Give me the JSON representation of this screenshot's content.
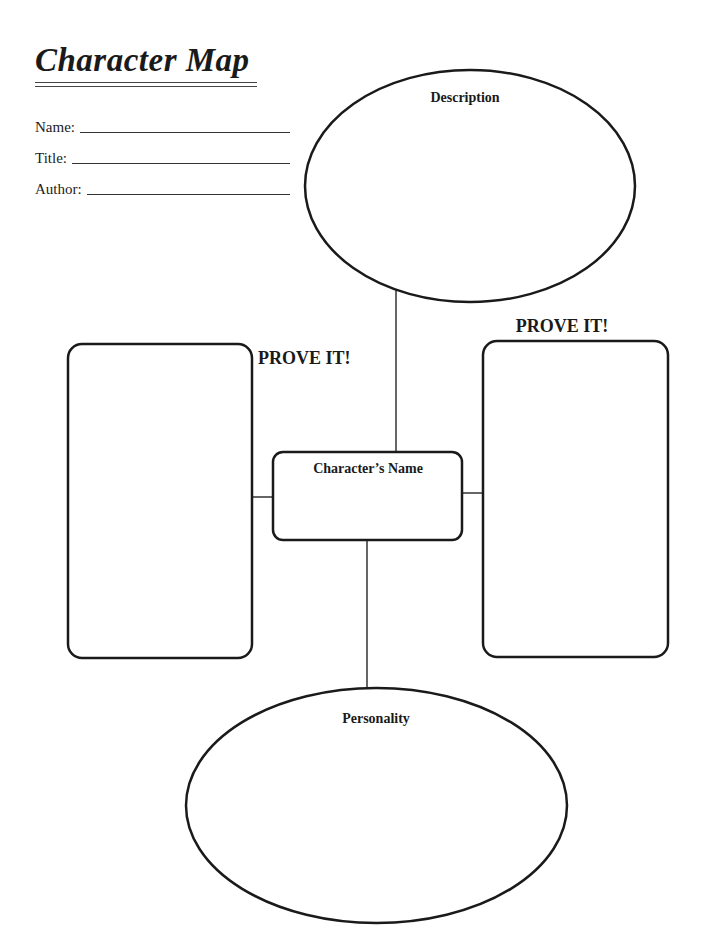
{
  "header": {
    "title": "Character Map"
  },
  "fields": [
    {
      "label": "Name:",
      "value": ""
    },
    {
      "label": "Title:",
      "value": ""
    },
    {
      "label": "Author:",
      "value": ""
    }
  ],
  "diagram": {
    "top_ellipse": {
      "label": "Description"
    },
    "center_box": {
      "label": "Character’s Name"
    },
    "bottom_ellipse": {
      "label": "Personality"
    },
    "left_box": {
      "heading": "PROVE IT!"
    },
    "right_box": {
      "heading": "PROVE IT!"
    }
  },
  "colors": {
    "stroke": "#1a1a1a",
    "background": "#ffffff"
  }
}
